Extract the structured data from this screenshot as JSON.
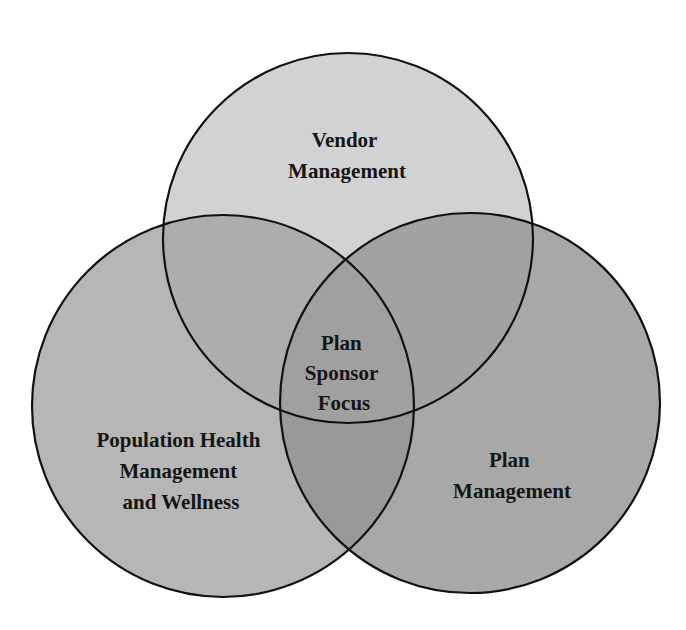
{
  "diagram": {
    "type": "venn",
    "circles": [
      {
        "id": "vendor",
        "label_lines": [
          "Vendor",
          "Management"
        ],
        "cx": 348,
        "cy": 238,
        "r": 185,
        "fill": "#d2d2d2"
      },
      {
        "id": "population",
        "label_lines": [
          "Population Health",
          "Management",
          "and Wellness"
        ],
        "cx": 223,
        "cy": 406,
        "r": 191,
        "fill": "#b6b6b6"
      },
      {
        "id": "plan",
        "label_lines": [
          "Plan",
          "Management"
        ],
        "cx": 470,
        "cy": 403,
        "r": 190,
        "fill": "#a8a8a8"
      }
    ],
    "center": {
      "label_lines": [
        "Plan",
        "Sponsor",
        "Focus"
      ]
    }
  }
}
